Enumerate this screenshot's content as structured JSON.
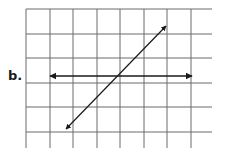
{
  "problem": {
    "label": "b."
  },
  "grid": {
    "vertical_lines_x": [
      26,
      50,
      73,
      97,
      120,
      144,
      167,
      191
    ],
    "horizontal_lines_y": [
      9,
      34,
      58,
      83,
      107,
      132
    ],
    "x_extent": [
      26,
      212
    ],
    "y_extent": [
      9,
      148
    ],
    "line_color": "#6b6b6b"
  },
  "lines": [
    {
      "name": "horizontal-line",
      "from": [
        50,
        76
      ],
      "to": [
        192,
        76
      ],
      "arrows": "both",
      "color": "#1a1a1a"
    },
    {
      "name": "diagonal-line",
      "from": [
        66,
        129
      ],
      "to": [
        166,
        26
      ],
      "arrows": "both",
      "color": "#1a1a1a"
    }
  ]
}
